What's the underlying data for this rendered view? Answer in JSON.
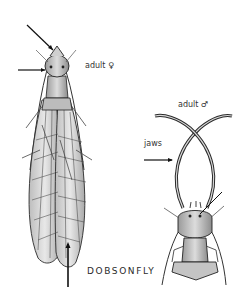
{
  "figure": {
    "title": "DOBSONFLY",
    "specimens": [
      {
        "id": "female",
        "label": "adult ♀",
        "view": "dorsal, wings folded"
      },
      {
        "id": "male",
        "label": "adult ♂",
        "view": "dorsal, head and thorax with long jaws"
      }
    ],
    "annotations": [
      {
        "label": "jaws",
        "target": "male mandible"
      }
    ],
    "colors": {
      "ink": "#1a1a1a",
      "shade": "#8a8a8a",
      "light_shade": "#cfcfcf",
      "background": "#ffffff"
    }
  }
}
